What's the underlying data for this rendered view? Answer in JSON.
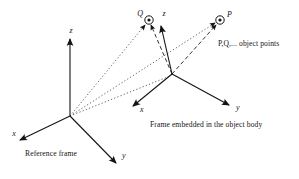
{
  "figure": {
    "reference_frame": {
      "caption": "Reference frame",
      "x_label": "x",
      "y_label": "y",
      "z_label": "z"
    },
    "object_frame": {
      "caption": "Frame embedded in the object body",
      "x_label": "x",
      "y_label": "y",
      "z_label": "z"
    },
    "points": {
      "q_label": "Q",
      "p_label": "P",
      "note": "P,Q,... object points"
    },
    "colors": {
      "ink": "#141414",
      "background": "#ffffff"
    }
  }
}
